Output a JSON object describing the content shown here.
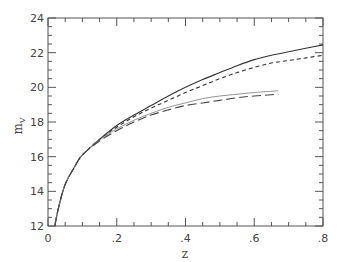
{
  "chart_data": {
    "type": "line",
    "title": "",
    "xlabel": "z",
    "ylabel": "m",
    "ylabel_subscript": "V",
    "xlim": [
      0,
      0.8
    ],
    "ylim": [
      12,
      24
    ],
    "grid": false,
    "legend": null,
    "x_ticks": [
      {
        "value": 0,
        "label": "0"
      },
      {
        "value": 0.2,
        "label": ".2"
      },
      {
        "value": 0.4,
        "label": ".4"
      },
      {
        "value": 0.6,
        "label": ".6"
      },
      {
        "value": 0.8,
        "label": ".8"
      }
    ],
    "y_ticks": [
      {
        "value": 12,
        "label": "12"
      },
      {
        "value": 14,
        "label": "14"
      },
      {
        "value": 16,
        "label": "16"
      },
      {
        "value": 18,
        "label": "18"
      },
      {
        "value": 20,
        "label": "20"
      },
      {
        "value": 22,
        "label": "22"
      },
      {
        "value": 24,
        "label": "24"
      }
    ],
    "series": [
      {
        "name": "upper-solid",
        "style": "solid",
        "color": "#333333",
        "x": [
          0.02,
          0.03,
          0.05,
          0.08,
          0.1,
          0.15,
          0.2,
          0.25,
          0.3,
          0.35,
          0.4,
          0.45,
          0.5,
          0.55,
          0.6,
          0.65,
          0.7,
          0.75,
          0.8
        ],
        "y": [
          12.0,
          13.0,
          14.4,
          15.5,
          16.1,
          17.0,
          17.8,
          18.4,
          18.95,
          19.5,
          20.0,
          20.45,
          20.85,
          21.25,
          21.6,
          21.85,
          22.05,
          22.25,
          22.45
        ]
      },
      {
        "name": "upper-short-dash",
        "style": "short-dash",
        "color": "#333333",
        "x": [
          0.02,
          0.03,
          0.05,
          0.08,
          0.1,
          0.15,
          0.2,
          0.25,
          0.3,
          0.35,
          0.4,
          0.45,
          0.5,
          0.55,
          0.6,
          0.65,
          0.7,
          0.75,
          0.8
        ],
        "y": [
          12.0,
          13.0,
          14.4,
          15.5,
          16.1,
          17.0,
          17.7,
          18.3,
          18.8,
          19.25,
          19.7,
          20.1,
          20.5,
          20.85,
          21.15,
          21.4,
          21.55,
          21.7,
          21.85
        ]
      },
      {
        "name": "lower-solid-thin",
        "style": "solid",
        "color": "#888888",
        "x": [
          0.02,
          0.03,
          0.05,
          0.08,
          0.1,
          0.15,
          0.2,
          0.25,
          0.3,
          0.35,
          0.4,
          0.45,
          0.5,
          0.55,
          0.6,
          0.67
        ],
        "y": [
          12.0,
          13.0,
          14.4,
          15.5,
          16.1,
          16.95,
          17.6,
          18.1,
          18.5,
          18.85,
          19.1,
          19.35,
          19.5,
          19.6,
          19.7,
          19.8
        ]
      },
      {
        "name": "lower-long-dash",
        "style": "long-dash",
        "color": "#444444",
        "x": [
          0.02,
          0.03,
          0.05,
          0.08,
          0.1,
          0.15,
          0.2,
          0.25,
          0.3,
          0.35,
          0.4,
          0.45,
          0.5,
          0.55,
          0.6,
          0.67
        ],
        "y": [
          12.0,
          13.0,
          14.4,
          15.5,
          16.1,
          16.9,
          17.5,
          18.0,
          18.4,
          18.7,
          18.95,
          19.1,
          19.25,
          19.4,
          19.5,
          19.6
        ]
      }
    ]
  },
  "layout": {
    "plot_left": 48,
    "plot_right": 323,
    "plot_top": 18,
    "plot_bottom": 226,
    "frame_color": "#555555"
  }
}
